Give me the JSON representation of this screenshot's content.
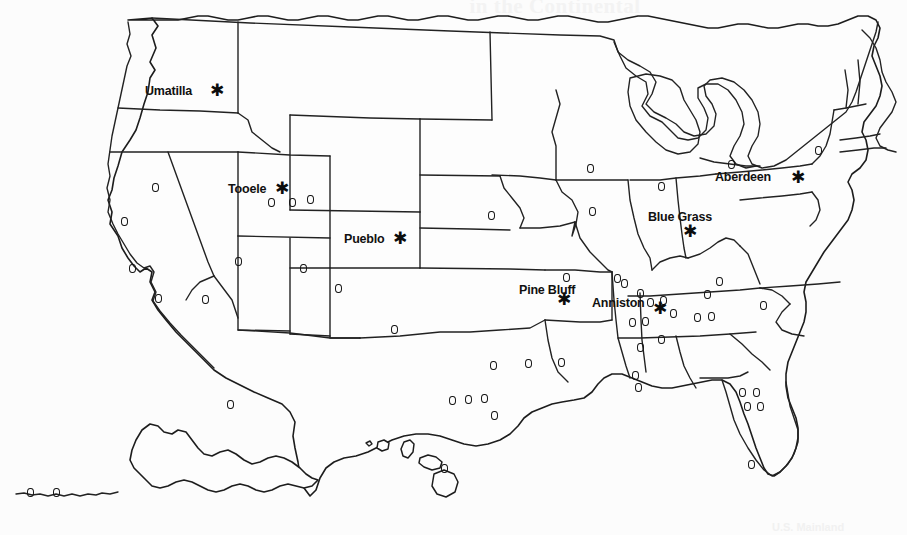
{
  "page": {
    "background_color": "#fcfcfc",
    "ink_color": "#1d1d1d",
    "ghost_title": "in the Continental",
    "ghost_credit": "U.S. Mainland"
  },
  "map": {
    "kind": "choropleth-outline",
    "region": "United States",
    "includes_insets": [
      "Alaska",
      "Hawaii"
    ],
    "star_symbol": "✱",
    "circle_symbol": "o"
  },
  "chart_data": {
    "type": "map",
    "title": "in the Continental",
    "xlabel": "",
    "ylabel": "",
    "legend_position": "none",
    "grid": false,
    "series": [
      {
        "name": "Stockpile sites (star)",
        "marker": "star",
        "values": [
          {
            "label": "Umatilla",
            "state": "Oregon",
            "x": 216,
            "y": 91,
            "label_x": 145,
            "label_y": 84
          },
          {
            "label": "Tooele",
            "state": "Utah",
            "x": 281,
            "y": 189,
            "label_x": 228,
            "label_y": 182
          },
          {
            "label": "Pueblo",
            "state": "Colorado",
            "x": 399,
            "y": 239,
            "label_x": 344,
            "label_y": 232
          },
          {
            "label": "Aberdeen",
            "state": "Maryland",
            "x": 797,
            "y": 178,
            "label_x": 715,
            "label_y": 170
          },
          {
            "label": "Blue Grass",
            "state": "Kentucky",
            "x": 689,
            "y": 232,
            "label_x": 648,
            "label_y": 210
          },
          {
            "label": "Pine Bluff",
            "state": "Arkansas",
            "x": 563,
            "y": 300,
            "label_x": 519,
            "label_y": 283
          },
          {
            "label": "Anniston",
            "state": "Alabama",
            "x": 659,
            "y": 309,
            "label_x": 592,
            "label_y": 296
          }
        ]
      },
      {
        "name": "Other sites (circle)",
        "marker": "circle",
        "points": [
          {
            "x": 155,
            "y": 187
          },
          {
            "x": 124,
            "y": 221
          },
          {
            "x": 132,
            "y": 268
          },
          {
            "x": 158,
            "y": 298
          },
          {
            "x": 205,
            "y": 299
          },
          {
            "x": 238,
            "y": 261
          },
          {
            "x": 271,
            "y": 202
          },
          {
            "x": 292,
            "y": 202
          },
          {
            "x": 303,
            "y": 268
          },
          {
            "x": 338,
            "y": 288
          },
          {
            "x": 310,
            "y": 199
          },
          {
            "x": 394,
            "y": 329
          },
          {
            "x": 491,
            "y": 215
          },
          {
            "x": 493,
            "y": 365
          },
          {
            "x": 484,
            "y": 398
          },
          {
            "x": 494,
            "y": 415
          },
          {
            "x": 528,
            "y": 363
          },
          {
            "x": 561,
            "y": 362
          },
          {
            "x": 590,
            "y": 168
          },
          {
            "x": 592,
            "y": 211
          },
          {
            "x": 617,
            "y": 278
          },
          {
            "x": 624,
            "y": 283
          },
          {
            "x": 640,
            "y": 293
          },
          {
            "x": 661,
            "y": 186
          },
          {
            "x": 663,
            "y": 300
          },
          {
            "x": 650,
            "y": 302
          },
          {
            "x": 632,
            "y": 322
          },
          {
            "x": 645,
            "y": 321
          },
          {
            "x": 673,
            "y": 313
          },
          {
            "x": 697,
            "y": 317
          },
          {
            "x": 711,
            "y": 316
          },
          {
            "x": 707,
            "y": 294
          },
          {
            "x": 719,
            "y": 281
          },
          {
            "x": 640,
            "y": 347
          },
          {
            "x": 635,
            "y": 375
          },
          {
            "x": 638,
            "y": 387
          },
          {
            "x": 661,
            "y": 339
          },
          {
            "x": 742,
            "y": 392
          },
          {
            "x": 756,
            "y": 392
          },
          {
            "x": 747,
            "y": 406
          },
          {
            "x": 760,
            "y": 406
          },
          {
            "x": 751,
            "y": 464
          },
          {
            "x": 763,
            "y": 305
          },
          {
            "x": 452,
            "y": 400
          },
          {
            "x": 468,
            "y": 399
          },
          {
            "x": 818,
            "y": 150
          },
          {
            "x": 731,
            "y": 164
          },
          {
            "x": 566,
            "y": 277
          },
          {
            "x": 230,
            "y": 404
          },
          {
            "x": 30,
            "y": 492
          },
          {
            "x": 56,
            "y": 492
          },
          {
            "x": 444,
            "y": 468
          }
        ]
      }
    ]
  },
  "labels": {
    "umatilla": "Umatilla",
    "tooele": "Tooele",
    "pueblo": "Pueblo",
    "aberdeen": "Aberdeen",
    "blue_grass": "Blue Grass",
    "pine_bluff": "Pine Bluff",
    "anniston": "Anniston"
  }
}
